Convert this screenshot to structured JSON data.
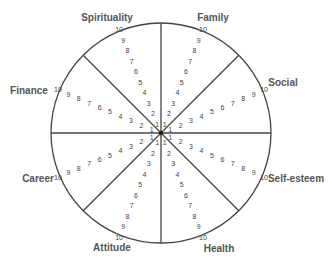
{
  "diagram": {
    "center": {
      "x": 161,
      "y": 133
    },
    "radius": 110,
    "line_color": "#444444",
    "text_color": "#555555",
    "scale": {
      "min": 1,
      "max": 10,
      "inner_r": 10,
      "outer_r": 112
    },
    "divider_angles_deg": [
      0,
      45,
      90,
      135,
      180,
      225,
      270,
      315
    ],
    "segments": [
      {
        "label": "Spirituality",
        "ray_angle_deg": -112,
        "label_pos": {
          "x": 107,
          "y": 17
        }
      },
      {
        "label": "Family",
        "ray_angle_deg": -68,
        "label_pos": {
          "x": 213,
          "y": 17
        }
      },
      {
        "label": "Social",
        "ray_angle_deg": -23,
        "label_pos": {
          "x": 283,
          "y": 82
        }
      },
      {
        "label": "Self-esteem",
        "ray_angle_deg": 23,
        "label_pos": {
          "x": 296,
          "y": 178
        }
      },
      {
        "label": "Health",
        "ray_angle_deg": 68,
        "label_pos": {
          "x": 219,
          "y": 248
        }
      },
      {
        "label": "Attitude",
        "ray_angle_deg": 112,
        "label_pos": {
          "x": 112,
          "y": 247
        }
      },
      {
        "label": "Career",
        "ray_angle_deg": 157,
        "label_pos": {
          "x": 38,
          "y": 178
        }
      },
      {
        "label": "Finance",
        "ray_angle_deg": -157,
        "label_pos": {
          "x": 29,
          "y": 90
        }
      }
    ],
    "scale_values": [
      "1",
      "2",
      "3",
      "4",
      "5",
      "6",
      "7",
      "8",
      "9",
      "10"
    ]
  }
}
